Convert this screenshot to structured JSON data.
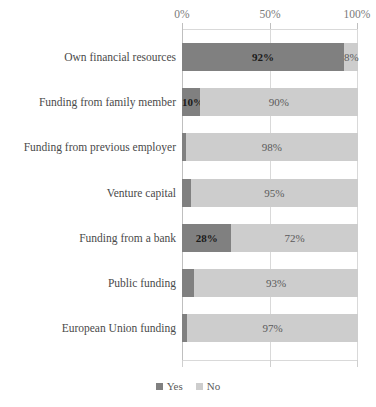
{
  "chart_data": {
    "type": "bar",
    "orientation": "horizontal",
    "stacked": true,
    "stack_mode": "percent",
    "title": "",
    "subtitle": "",
    "xlabel": "",
    "ylabel": "",
    "xlim": [
      0,
      100
    ],
    "xticks": [
      0,
      50,
      100
    ],
    "xtick_labels": [
      "0%",
      "50%",
      "100%"
    ],
    "grid": true,
    "grid_axis": "x",
    "legend_position": "bottom",
    "categories": [
      "Own financial resources",
      "Funding from family member",
      "Funding from previous employer",
      "Venture capital",
      "Funding from a bank",
      "Public funding",
      "European Union funding"
    ],
    "series": [
      {
        "name": "Yes",
        "color": "#808080",
        "values": [
          92,
          10,
          2,
          5,
          28,
          7,
          3
        ],
        "data_labels": [
          "92%",
          "10%",
          "",
          "",
          "28%",
          "",
          ""
        ]
      },
      {
        "name": "No",
        "color": "#cdcdcd",
        "values": [
          8,
          90,
          98,
          95,
          72,
          93,
          97
        ],
        "data_labels": [
          "8%",
          "90%",
          "98%",
          "95%",
          "72%",
          "93%",
          "97%"
        ]
      }
    ],
    "legend_entries": [
      "Yes",
      "No"
    ]
  },
  "axis": {
    "tick_0": "0%",
    "tick_50": "50%",
    "tick_100": "100%"
  },
  "rows": [
    {
      "label": "Own financial resources",
      "yes_value": 92,
      "yes_label": "92%",
      "yes_label_visible": true,
      "no_value": 8,
      "no_label": "8%",
      "no_label_visible": true
    },
    {
      "label": "Funding from family member",
      "yes_value": 10,
      "yes_label": "10%",
      "yes_label_visible": true,
      "no_value": 90,
      "no_label": "90%",
      "no_label_visible": true
    },
    {
      "label": "Funding from previous employer",
      "yes_value": 2,
      "yes_label": "2%",
      "yes_label_visible": false,
      "no_value": 98,
      "no_label": "98%",
      "no_label_visible": true
    },
    {
      "label": "Venture capital",
      "yes_value": 5,
      "yes_label": "5%",
      "yes_label_visible": false,
      "no_value": 95,
      "no_label": "95%",
      "no_label_visible": true
    },
    {
      "label": "Funding from a bank",
      "yes_value": 28,
      "yes_label": "28%",
      "yes_label_visible": true,
      "no_value": 72,
      "no_label": "72%",
      "no_label_visible": true
    },
    {
      "label": "Public funding",
      "yes_value": 7,
      "yes_label": "7%",
      "yes_label_visible": false,
      "no_value": 93,
      "no_label": "93%",
      "no_label_visible": true
    },
    {
      "label": "European Union funding",
      "yes_value": 3,
      "yes_label": "3%",
      "yes_label_visible": false,
      "no_value": 97,
      "no_label": "97%",
      "no_label_visible": true
    }
  ],
  "legend": {
    "items": [
      {
        "label": "Yes",
        "color": "#808080"
      },
      {
        "label": "No",
        "color": "#cdcdcd"
      }
    ]
  }
}
